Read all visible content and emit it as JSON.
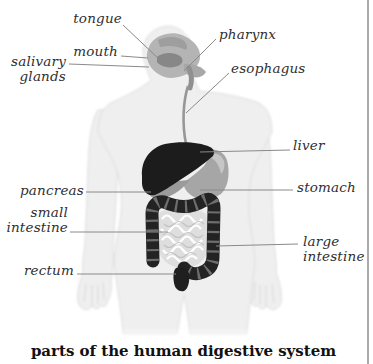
{
  "figure": {
    "caption": "parts of the human digestive system",
    "labels": {
      "tongue": "tongue",
      "mouth": "mouth",
      "salivary_glands": "salivary glands",
      "pharynx": "pharynx",
      "esophagus": "esophagus",
      "liver": "liver",
      "stomach": "stomach",
      "pancreas": "pancreas",
      "small_intestine": "small intestine",
      "large_intestine": "large intestine",
      "rectum": "rectum"
    }
  },
  "colors": {
    "label_text": "#2f2f2f",
    "leader_line": "#8a8a8a",
    "body_silhouette": "#efefef",
    "body_edge": "#dcdcdc",
    "head_organ": "#b4b4b4",
    "liver": "#1c1c1c",
    "stomach": "#a6a6a6",
    "large_intestine": "#232323",
    "small_intestine": "#dedede",
    "rectum": "#1f1f1f",
    "border": "#ababab",
    "caption_text": "#111111"
  }
}
